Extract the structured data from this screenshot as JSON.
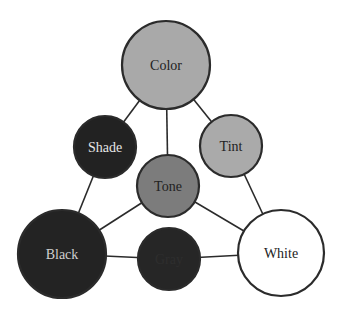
{
  "diagram": {
    "title": "",
    "nodes": [
      {
        "id": "color",
        "label": "Color",
        "cx": 166,
        "cy": 65,
        "r": 44,
        "fill": "#a9a9a9",
        "text_color": "#222222"
      },
      {
        "id": "shade",
        "label": "Shade",
        "cx": 105,
        "cy": 147,
        "r": 31,
        "fill": "#222222",
        "text_color": "#e6e6e6"
      },
      {
        "id": "tint",
        "label": "Tint",
        "cx": 231,
        "cy": 146,
        "r": 31,
        "fill": "#aaaaaa",
        "text_color": "#222222"
      },
      {
        "id": "tone",
        "label": "Tone",
        "cx": 168,
        "cy": 186,
        "r": 31,
        "fill": "#7c7c7c",
        "text_color": "#222222"
      },
      {
        "id": "black",
        "label": "Black",
        "cx": 62,
        "cy": 254,
        "r": 44,
        "fill": "#232323",
        "text_color": "#cfcfcf"
      },
      {
        "id": "gray",
        "label": "Gray",
        "cx": 169,
        "cy": 259,
        "r": 31,
        "fill": "#262626",
        "text_color": "#2e2e2e"
      },
      {
        "id": "white",
        "label": "White",
        "cx": 281,
        "cy": 253,
        "r": 43,
        "fill": "#ffffff",
        "text_color": "#222222"
      }
    ],
    "edges": [
      {
        "from": "color",
        "to": "shade"
      },
      {
        "from": "color",
        "to": "tint"
      },
      {
        "from": "color",
        "to": "tone"
      },
      {
        "from": "shade",
        "to": "black"
      },
      {
        "from": "tint",
        "to": "white"
      },
      {
        "from": "tone",
        "to": "black"
      },
      {
        "from": "tone",
        "to": "white"
      },
      {
        "from": "black",
        "to": "gray"
      },
      {
        "from": "gray",
        "to": "white"
      }
    ],
    "colors": {
      "stroke": "#2b2b2b",
      "background": "#ffffff"
    }
  }
}
